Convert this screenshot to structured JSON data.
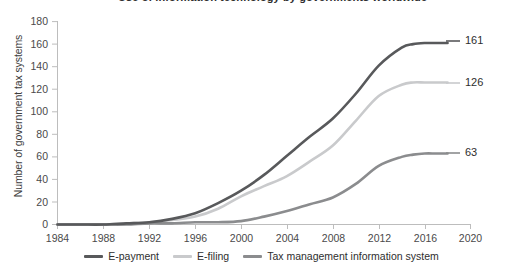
{
  "title": "Use of information technology by governments worldwide",
  "axis": {
    "ylabel": "Number of government tax systems",
    "xlabel": "",
    "yticks": [
      "0",
      "20",
      "40",
      "60",
      "80",
      "100",
      "120",
      "140",
      "160",
      "180"
    ],
    "xticks": [
      "1984",
      "1988",
      "1992",
      "1996",
      "2000",
      "2004",
      "2008",
      "2012",
      "2016",
      "2020"
    ]
  },
  "legend": {
    "items": [
      {
        "label": "E-payment",
        "color": "#58595b"
      },
      {
        "label": "E-filing",
        "color": "#c9cacc"
      },
      {
        "label": "Tax management information system",
        "color": "#8b8c8e"
      }
    ]
  },
  "end_labels": {
    "epayment": "161",
    "efiling": "126",
    "tmis": "63"
  },
  "colors": {
    "epayment": "#58595b",
    "efiling": "#c9cacc",
    "tmis": "#8b8c8e",
    "axis": "#bcbcbc",
    "text": "#3d3d3d"
  },
  "chart_data": {
    "type": "line",
    "title": "Use of information technology by governments worldwide",
    "xlabel": "",
    "ylabel": "Number of government tax systems",
    "xlim": [
      1984,
      2020
    ],
    "ylim": [
      0,
      180
    ],
    "grid": false,
    "legend_position": "bottom",
    "x": [
      1984,
      1986,
      1988,
      1990,
      1992,
      1994,
      1996,
      1998,
      2000,
      2002,
      2004,
      2006,
      2008,
      2010,
      2012,
      2014,
      2015,
      2016,
      2017,
      2018
    ],
    "series": [
      {
        "name": "E-payment",
        "color": "#58595b",
        "end_label": "161",
        "values": [
          0,
          0,
          0,
          1,
          2,
          5,
          10,
          19,
          30,
          44,
          61,
          78,
          94,
          116,
          141,
          157,
          160,
          161,
          161,
          161
        ]
      },
      {
        "name": "E-filing",
        "color": "#c9cacc",
        "end_label": "126",
        "values": [
          0,
          0,
          0,
          1,
          2,
          4,
          7,
          14,
          25,
          34,
          43,
          56,
          70,
          92,
          114,
          124,
          126,
          126,
          126,
          126
        ]
      },
      {
        "name": "Tax management information system",
        "color": "#8b8c8e",
        "end_label": "63",
        "values": [
          0,
          0,
          0,
          0,
          1,
          1,
          2,
          2,
          3,
          7,
          12,
          18,
          24,
          36,
          52,
          60,
          62,
          63,
          63,
          63
        ]
      }
    ]
  }
}
